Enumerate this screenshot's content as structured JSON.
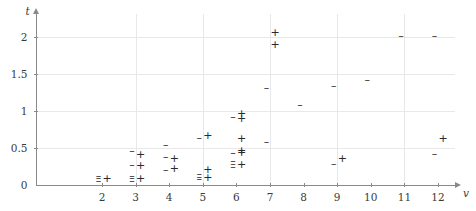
{
  "chart_data": {
    "type": "scatter",
    "title": "",
    "xlabel": "v",
    "ylabel": "t",
    "xlim": [
      1.3,
      12.9
    ],
    "ylim": [
      0,
      2.25
    ],
    "grid": true,
    "legend_position": "none",
    "x_ticks": [
      2,
      3,
      4,
      5,
      6,
      7,
      8,
      9,
      10,
      11,
      12
    ],
    "x_tick_labels": [
      "2",
      "3",
      "4",
      "5",
      "6",
      "7",
      "8",
      "9",
      "10",
      "11",
      "12"
    ],
    "y_ticks": [
      0,
      0.5,
      1,
      1.5,
      2
    ],
    "y_tick_labels": [
      "0",
      "0.5",
      "1",
      "1.5",
      "2"
    ],
    "x_gridlines": [
      3,
      5,
      7,
      9,
      11
    ],
    "y_gridlines": [
      0.5,
      1,
      1.5,
      2
    ],
    "series": [
      {
        "name": "dash",
        "marker": "–",
        "points": [
          {
            "x": 2,
            "y": 0.12
          },
          {
            "x": 2,
            "y": 0.09
          },
          {
            "x": 2,
            "y": 0.06
          },
          {
            "x": 3,
            "y": 0.46
          },
          {
            "x": 3,
            "y": 0.27
          },
          {
            "x": 3,
            "y": 0.12
          },
          {
            "x": 3,
            "y": 0.09
          },
          {
            "x": 3,
            "y": 0.06
          },
          {
            "x": 4,
            "y": 0.55
          },
          {
            "x": 4,
            "y": 0.38
          },
          {
            "x": 4,
            "y": 0.21
          },
          {
            "x": 5,
            "y": 0.64
          },
          {
            "x": 5,
            "y": 0.15
          },
          {
            "x": 5,
            "y": 0.11
          },
          {
            "x": 5,
            "y": 0.08
          },
          {
            "x": 6,
            "y": 0.93
          },
          {
            "x": 6,
            "y": 0.44
          },
          {
            "x": 6,
            "y": 0.32
          },
          {
            "x": 6,
            "y": 0.28
          },
          {
            "x": 6,
            "y": 0.25
          },
          {
            "x": 7,
            "y": 1.32
          },
          {
            "x": 7,
            "y": 0.58
          },
          {
            "x": 8,
            "y": 1.09
          },
          {
            "x": 9,
            "y": 1.34
          },
          {
            "x": 9,
            "y": 0.28
          },
          {
            "x": 10,
            "y": 1.43
          },
          {
            "x": 11,
            "y": 2.02
          },
          {
            "x": 12,
            "y": 2.02
          },
          {
            "x": 12,
            "y": 0.42
          }
        ]
      },
      {
        "name": "plus",
        "marker": "+",
        "points": [
          {
            "x": 2,
            "y": 0.08
          },
          {
            "x": 3,
            "y": 0.41
          },
          {
            "x": 3,
            "y": 0.26
          },
          {
            "x": 3,
            "y": 0.08
          },
          {
            "x": 4,
            "y": 0.36
          },
          {
            "x": 4,
            "y": 0.22
          },
          {
            "x": 5,
            "y": 0.67
          },
          {
            "x": 5,
            "y": 0.21
          },
          {
            "x": 5,
            "y": 0.1
          },
          {
            "x": 6,
            "y": 0.96
          },
          {
            "x": 6,
            "y": 0.9
          },
          {
            "x": 6,
            "y": 0.63
          },
          {
            "x": 6,
            "y": 0.46
          },
          {
            "x": 6,
            "y": 0.43
          },
          {
            "x": 6,
            "y": 0.27
          },
          {
            "x": 7,
            "y": 2.06
          },
          {
            "x": 7,
            "y": 1.9
          },
          {
            "x": 9,
            "y": 0.35
          },
          {
            "x": 12,
            "y": 0.62
          }
        ]
      }
    ]
  }
}
